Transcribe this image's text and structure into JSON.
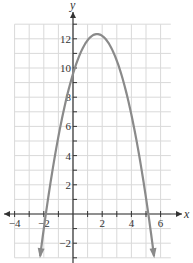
{
  "chart_data": {
    "type": "line",
    "title": "",
    "xlabel": "x",
    "ylabel": "y",
    "xlim": [
      -4.5,
      7
    ],
    "ylim": [
      -3,
      13
    ],
    "grid": true,
    "x_ticks": [
      -4,
      -2,
      2,
      4,
      6
    ],
    "y_ticks": [
      -2,
      2,
      4,
      6,
      8,
      10,
      12
    ],
    "x_tick_labels": [
      "−4",
      "−2",
      "2",
      "4",
      "6"
    ],
    "y_tick_labels": [
      "−2",
      "2",
      "4",
      "6",
      "8",
      "10",
      "12"
    ],
    "series": [
      {
        "name": "parabola",
        "color": "#8a8a8a",
        "equation_estimate": "y = -x^2 + 3.3x + 9.6",
        "vertex": [
          1.65,
          12.3
        ],
        "x_intercepts": [
          -1.8,
          5.1
        ],
        "y_intercept": 9.6,
        "arrows_at_ends": true,
        "x": [
          -2.3,
          -1.8,
          -1,
          0,
          1,
          1.65,
          2,
          3,
          4,
          5,
          5.1,
          5.6
        ],
        "y": [
          -2.5,
          0,
          5.3,
          9.6,
          11.9,
          12.3,
          12.2,
          10.5,
          6.8,
          1.1,
          0,
          -2.4
        ]
      }
    ]
  },
  "labels": {
    "x_axis": "x",
    "y_axis": "y"
  },
  "colors": {
    "grid": "#d9d9d9",
    "axis": "#333333",
    "curve": "#8a8a8a"
  }
}
